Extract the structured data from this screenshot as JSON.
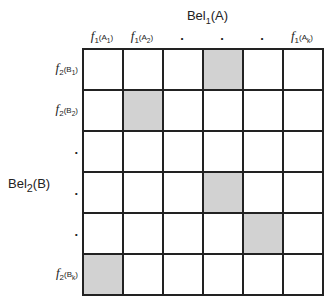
{
  "title": {
    "main": "Bel",
    "sub": "1",
    "arg": "(A)"
  },
  "side_label": {
    "main": "Bel",
    "sub": "2",
    "arg": "(B)"
  },
  "columns": [
    {
      "f": "f",
      "fs": "1",
      "arg": "(A",
      "as": "1",
      "close": ")"
    },
    {
      "f": "f",
      "fs": "1",
      "arg": "(A",
      "as": "2",
      "close": ")"
    },
    {
      "dot": "."
    },
    {
      "dot": "."
    },
    {
      "dot": "."
    },
    {
      "f": "f",
      "fs": "1",
      "arg": "(A",
      "as": "k",
      "close": ")"
    }
  ],
  "rows": [
    {
      "f": "f",
      "fs": "2",
      "arg": "(B",
      "as": "1",
      "close": ")"
    },
    {
      "f": "f",
      "fs": "2",
      "arg": "(B",
      "as": "2",
      "close": ")"
    },
    {
      "dot": "."
    },
    {
      "dot": "."
    },
    {
      "dot": "."
    },
    {
      "f": "f",
      "fs": "2",
      "arg": "(B",
      "as": "k",
      "close": ")"
    }
  ],
  "shaded_cells": [
    [
      0,
      3
    ],
    [
      1,
      1
    ],
    [
      3,
      3
    ],
    [
      4,
      4
    ],
    [
      5,
      0
    ]
  ],
  "colors": {
    "shade": "#d2d2d2",
    "line": "#222222"
  }
}
